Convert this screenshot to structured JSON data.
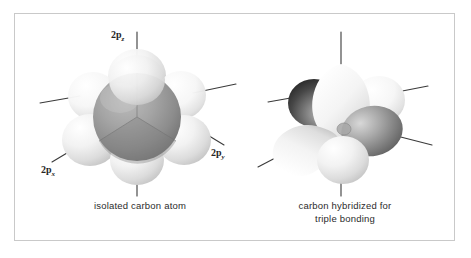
{
  "figure": {
    "background_color": "#ffffff",
    "frame_color": "#c9c9c9",
    "line_color": "#3a3a3a",
    "text_color": "#2b2b2b"
  },
  "left_diagram": {
    "caption": "isolated carbon atom",
    "labels": {
      "pz": {
        "base": "2p",
        "sub": "z"
      },
      "px": {
        "base": "2p",
        "sub": "x"
      },
      "py": {
        "base": "2p",
        "sub": "y"
      }
    },
    "description": "dark gray central 2s sphere surrounded by six pale p-orbital lobes",
    "core_color": "#9a9a9a",
    "lobe_color": "#e9e9e9"
  },
  "right_diagram": {
    "caption": "carbon hybridized for\ntriple bonding",
    "description": "two pale teardrop sp-hybrid lobes with two dark p-orbital lobes",
    "hybrid_lobe_color": "#f0f0f0",
    "dark_lobe_color": "#3b3b3b",
    "mid_lobe_color": "#8f8f8f"
  }
}
